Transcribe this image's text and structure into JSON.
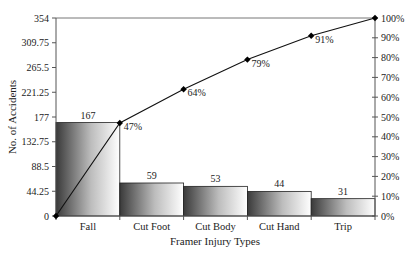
{
  "chart_data": {
    "type": "bar",
    "subtype": "pareto",
    "title": "",
    "xlabel": "Framer Injury Types",
    "ylabel": "No. of Accidents",
    "y2label": "",
    "categories": [
      "Fall",
      "Cut Foot",
      "Cut Body",
      "Cut Hand",
      "Trip"
    ],
    "series": [
      {
        "name": "No. of Accidents",
        "type": "bar",
        "axis": "left",
        "values": [
          167,
          59,
          53,
          44,
          31
        ]
      },
      {
        "name": "Cumulative %",
        "type": "line",
        "axis": "right",
        "values": [
          47,
          64,
          79,
          91,
          100
        ],
        "start_value": 0
      }
    ],
    "bar_labels": [
      "167",
      "59",
      "53",
      "44",
      "31"
    ],
    "line_labels": [
      "47%",
      "64%",
      "79%",
      "91%",
      "100%"
    ],
    "ylim": [
      0,
      354
    ],
    "y2lim": [
      0,
      100
    ],
    "yticks": [
      "0",
      "44.25",
      "88.5",
      "132.75",
      "177",
      "221.25",
      "265.5",
      "309.75",
      "354"
    ],
    "y2ticks": [
      "0%",
      "10%",
      "20%",
      "30%",
      "40%",
      "50%",
      "60%",
      "70%",
      "80%",
      "90%",
      "100%"
    ],
    "grid": false,
    "legend": "none"
  }
}
